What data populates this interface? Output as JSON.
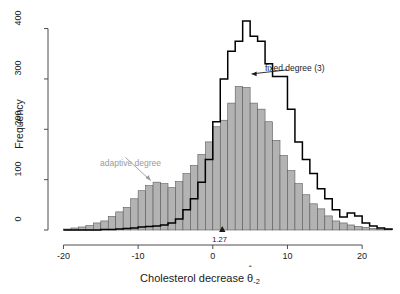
{
  "chart_data": {
    "type": "bar",
    "title": "",
    "xlabel": "Cholesterol decrease",
    "xlabel_symbol": "θ",
    "xlabel_hat": "ˆ",
    "xlabel_sub": "-2",
    "ylabel": "Frequency",
    "xlim": [
      -21,
      24
    ],
    "ylim": [
      0,
      425
    ],
    "xticks": [
      -20,
      -10,
      0,
      10,
      20
    ],
    "xtick_labels": [
      "-20",
      "-10",
      "0",
      "10",
      "20"
    ],
    "yticks": [
      0,
      100,
      200,
      300,
      400
    ],
    "ytick_labels": [
      "0",
      "100",
      "200",
      "300",
      "400"
    ],
    "grid": false,
    "bin_width": 1,
    "bin_starts": [
      -20,
      -19,
      -18,
      -17,
      -16,
      -15,
      -14,
      -13,
      -12,
      -11,
      -10,
      -9,
      -8,
      -7,
      -6,
      -5,
      -4,
      -3,
      -2,
      -1,
      0,
      1,
      2,
      3,
      4,
      5,
      6,
      7,
      8,
      9,
      10,
      11,
      12,
      13,
      14,
      15,
      16,
      17,
      18,
      19,
      20,
      21,
      22,
      23
    ],
    "series": [
      {
        "name": "adaptive degree",
        "style": "filled-bars",
        "color": "#b3b3b3",
        "edge_color": "#5a5a5a",
        "values": [
          2,
          4,
          6,
          9,
          14,
          18,
          27,
          36,
          45,
          62,
          78,
          88,
          95,
          92,
          84,
          96,
          112,
          128,
          150,
          175,
          205,
          218,
          252,
          285,
          283,
          252,
          240,
          215,
          178,
          148,
          118,
          92,
          70,
          52,
          42,
          28,
          18,
          14,
          10,
          7,
          5,
          3,
          2,
          1
        ]
      },
      {
        "name": "fixed degree (3)",
        "style": "step-outline",
        "color": "#000000",
        "values": [
          0,
          0,
          0,
          0,
          0,
          1,
          1,
          2,
          3,
          4,
          6,
          7,
          8,
          10,
          14,
          22,
          40,
          62,
          95,
          140,
          215,
          300,
          355,
          375,
          415,
          385,
          375,
          330,
          305,
          305,
          240,
          175,
          140,
          112,
          82,
          62,
          40,
          26,
          34,
          28,
          14,
          8,
          4,
          2
        ]
      }
    ],
    "annotations": [
      {
        "id": "fixed-degree",
        "text": "fixed degree (3)",
        "color": "#1a1a1a",
        "x": 10.5,
        "y": 318,
        "arrow_to_x": 5.2,
        "arrow_to_y": 310
      },
      {
        "id": "adaptive-degree",
        "text": "adaptive degree",
        "color": "#9a9a9a",
        "x": -12.5,
        "y": 152,
        "arrow_to_x": -8.3,
        "arrow_to_y": 98
      },
      {
        "id": "mean-marker",
        "text": "1.27",
        "color": "#1a1a1a",
        "value": 1.27,
        "marker": "triangle-up"
      }
    ]
  },
  "legend": {
    "fixed_label": "fixed degree (3)",
    "adaptive_label": "adaptive degree",
    "mean_label": "1.27"
  },
  "axes": {
    "x_title_main": "Cholesterol decrease",
    "x_title_theta": "θ",
    "x_title_hat": "ˆ",
    "x_title_sub": "-2",
    "y_title": "Frequency"
  },
  "colors": {
    "bar_fill": "#b3b3b3",
    "bar_edge": "#5a5a5a",
    "outline": "#000000",
    "axis": "#4d4d4d",
    "adaptive_text": "#9a9a9a",
    "background": "#ffffff"
  }
}
